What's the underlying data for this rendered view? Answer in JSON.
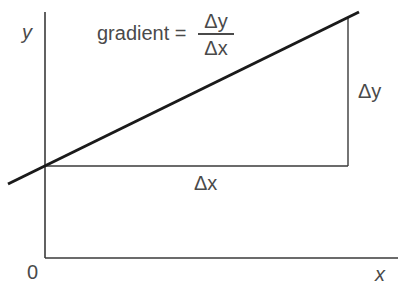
{
  "diagram": {
    "axes": {
      "y_label": "y",
      "x_label": "x",
      "origin_label": "0"
    },
    "formula": {
      "lhs": "gradient =",
      "numerator": "Δy",
      "denominator": "Δx"
    },
    "triangle": {
      "run_label": "Δx",
      "rise_label": "Δy"
    },
    "colors": {
      "line": "#1a1a1a",
      "axis": "#3a3a3a",
      "text": "#4a4a4a",
      "background": "#ffffff"
    }
  }
}
